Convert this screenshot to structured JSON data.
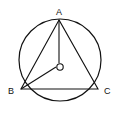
{
  "diagram": {
    "points": {
      "A": {
        "label": "A",
        "x": 59,
        "y": 21
      },
      "B": {
        "label": "B",
        "x": 21,
        "y": 89
      },
      "C": {
        "label": "C",
        "x": 98,
        "y": 89
      },
      "O": {
        "label": "O",
        "x": 60,
        "y": 66
      }
    },
    "circle": {
      "cx": 60,
      "cy": 60,
      "r": 41
    },
    "segments": [
      "AB",
      "BC",
      "CA",
      "AO",
      "BO"
    ]
  }
}
